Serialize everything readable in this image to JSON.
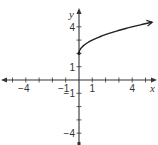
{
  "chart_data": {
    "type": "line",
    "title": "",
    "xlabel": "x",
    "ylabel": "y",
    "xlim": [
      -5.8,
      5.8
    ],
    "ylim": [
      -5,
      5.2
    ],
    "grid": false,
    "x_tick_labels": [
      {
        "value": -4,
        "label": "−4"
      },
      {
        "value": -1,
        "label": "−1"
      },
      {
        "value": 1,
        "label": "1"
      },
      {
        "value": 4,
        "label": "4"
      }
    ],
    "y_tick_labels": [
      {
        "value": 4,
        "label": "4"
      },
      {
        "value": 1,
        "label": "1"
      },
      {
        "value": -1,
        "label": "−1"
      },
      {
        "value": -4,
        "label": "−4"
      }
    ],
    "x_ticks": [
      -5,
      -4,
      -3,
      -2,
      -1,
      1,
      2,
      3,
      4,
      5
    ],
    "y_ticks": [
      -4,
      -3,
      -2,
      -1,
      1,
      2,
      3,
      4
    ],
    "series": [
      {
        "name": "y = √x + 2",
        "start_point": {
          "x": 0,
          "y": 2,
          "closed": true
        },
        "end_arrow": true,
        "x": [
          0,
          0.05,
          0.2,
          0.5,
          1,
          1.5,
          2,
          2.5,
          3,
          3.5,
          4,
          4.5,
          5,
          5.5
        ],
        "y": [
          2,
          2.22,
          2.45,
          2.71,
          3,
          3.22,
          3.41,
          3.58,
          3.73,
          3.87,
          4,
          4.12,
          4.24,
          4.35
        ]
      }
    ],
    "colors": {
      "axis": "#333333",
      "curve": "#222222",
      "text": "#333333"
    }
  }
}
